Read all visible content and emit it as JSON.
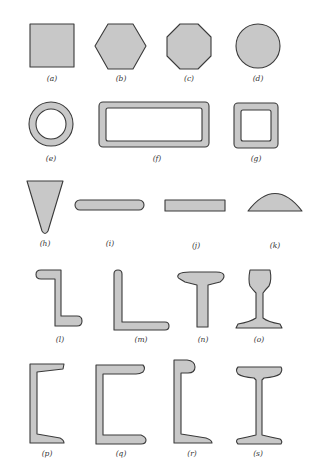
{
  "figure": {
    "background": "#ffffff",
    "fill_color": "#c8c8c8",
    "stroke_color": "#3a3a3a",
    "shapes": [
      {
        "id": "a",
        "label": "(a)",
        "name": "square"
      },
      {
        "id": "b",
        "label": "(b)",
        "name": "hexagon"
      },
      {
        "id": "c",
        "label": "(c)",
        "name": "octagon"
      },
      {
        "id": "d",
        "label": "(d)",
        "name": "circle"
      },
      {
        "id": "e",
        "label": "(e)",
        "name": "round-tube"
      },
      {
        "id": "f",
        "label": "(f)",
        "name": "rectangular-tube"
      },
      {
        "id": "g",
        "label": "(g)",
        "name": "square-tube"
      },
      {
        "id": "h",
        "label": "(h)",
        "name": "triangle"
      },
      {
        "id": "i",
        "label": "(i)",
        "name": "rounded-flat-bar"
      },
      {
        "id": "j",
        "label": "(j)",
        "name": "flat-bar"
      },
      {
        "id": "k",
        "label": "(k)",
        "name": "half-round"
      },
      {
        "id": "l",
        "label": "(l)",
        "name": "z-section"
      },
      {
        "id": "m",
        "label": "(m)",
        "name": "angle"
      },
      {
        "id": "n",
        "label": "(n)",
        "name": "tee"
      },
      {
        "id": "o",
        "label": "(o)",
        "name": "rail"
      },
      {
        "id": "p",
        "label": "(p)",
        "name": "channel-tapered"
      },
      {
        "id": "q",
        "label": "(q)",
        "name": "channel"
      },
      {
        "id": "r",
        "label": "(r)",
        "name": "bulb-channel"
      },
      {
        "id": "s",
        "label": "(s)",
        "name": "i-beam"
      }
    ]
  }
}
